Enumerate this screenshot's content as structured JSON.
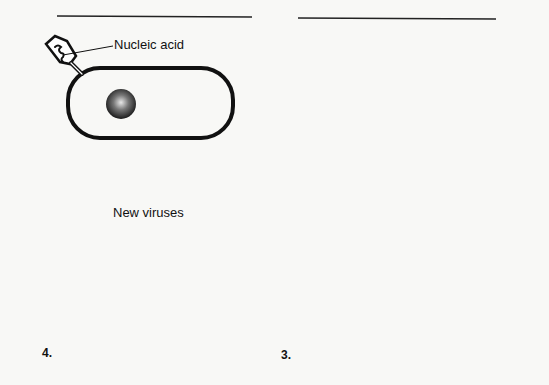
{
  "labels": {
    "nucleic_acid": "Nucleic acid",
    "new_viruses": "New viruses"
  },
  "steps": [
    {
      "id": 1,
      "number": "",
      "description": "Virus attaches to bacterium and injects nucleic acid"
    },
    {
      "id": 2,
      "number": "",
      "description": "Viral nucleic acid replicates inside cell"
    },
    {
      "id": 3,
      "number": "3.",
      "description": "Viral parts are assembled"
    },
    {
      "id": 4,
      "number": "4.",
      "description": "Cell bursts releasing new viruses"
    }
  ],
  "colors": {
    "ink": "#111111",
    "paper": "#f8f8f6"
  }
}
